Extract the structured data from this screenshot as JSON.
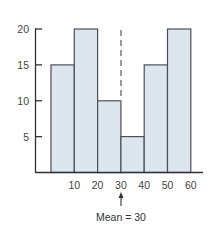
{
  "chart_data": {
    "type": "bar",
    "subtype": "histogram",
    "title": "",
    "xlabel": "",
    "ylabel": "",
    "bins": [
      [
        0,
        10
      ],
      [
        10,
        20
      ],
      [
        20,
        30
      ],
      [
        30,
        40
      ],
      [
        40,
        50
      ],
      [
        50,
        60
      ]
    ],
    "categories": [
      "0-10",
      "10-20",
      "20-30",
      "30-40",
      "40-50",
      "50-60"
    ],
    "values": [
      15,
      20,
      10,
      5,
      15,
      20
    ],
    "x_ticks": [
      "10",
      "20",
      "30",
      "40",
      "50",
      "60"
    ],
    "y_ticks": [
      "5",
      "10",
      "15",
      "20"
    ],
    "ylim": [
      0,
      20
    ],
    "xlim": [
      0,
      60
    ],
    "grid": false,
    "legend": null,
    "annotations": [
      {
        "type": "dashed-vertical-line",
        "x": 30,
        "label": ""
      },
      {
        "type": "arrow",
        "x": 30,
        "label": "Mean = 30"
      }
    ],
    "colors": {
      "bar_fill": "#dde6ef",
      "bar_stroke": "#4a4f57",
      "axis": "#2f3338",
      "dashed_line": "#555a60"
    }
  },
  "mean_label": "Mean = 30"
}
